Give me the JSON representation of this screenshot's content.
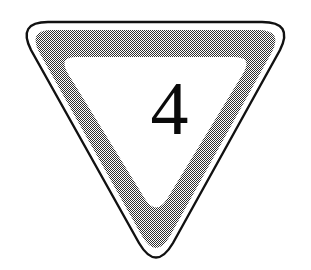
{
  "figure": {
    "kind": "road-sign-illustration",
    "sign_shape": "inverted-rounded-triangle",
    "sign_label": "4",
    "background_color": "#ffffff",
    "outline_color": "#000000",
    "gap_color": "#ffffff",
    "band_color": "#808080",
    "band_texture": "50% checkerboard dither",
    "interior_color": "#ffffff",
    "numeral_color": "#0a0a0a",
    "outline_stroke_px": 2,
    "gap_stroke_px": 4,
    "band_stroke_px": 28,
    "canvas_width": 311,
    "canvas_height": 270
  }
}
